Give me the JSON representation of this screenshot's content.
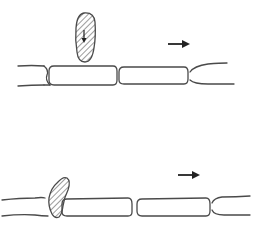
{
  "figure": {
    "colors": {
      "background": "#ffffff",
      "stroke": "#4a4a4a",
      "arrow": "#222222"
    },
    "panels": [
      {
        "id": "top",
        "label": "",
        "elements": {
          "hatched_cell": "elongated hatched cell above filament with internal downward arrow",
          "filament_cells": 2,
          "direction_arrow": "right"
        }
      },
      {
        "id": "bottom",
        "label": "",
        "elements": {
          "hatched_cell": "curved hatched cell attached at filament junction",
          "filament_cells": 2,
          "direction_arrow": "right"
        }
      }
    ]
  }
}
